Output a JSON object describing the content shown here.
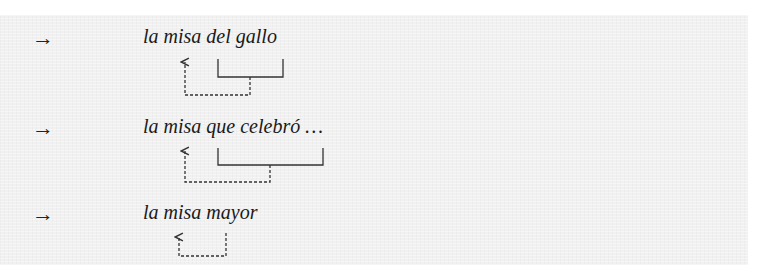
{
  "examples": [
    {
      "marker": "→",
      "text": "la misa del gallo",
      "head_word": "misa",
      "modifier": "del gallo",
      "modifier_type": "prepositional phrase"
    },
    {
      "marker": "→",
      "text": "la misa que celebró …",
      "head_word": "misa",
      "modifier": "que celebró …",
      "modifier_type": "relative clause"
    },
    {
      "marker": "→",
      "text": "la misa mayor",
      "head_word": "misa",
      "modifier": "mayor",
      "modifier_type": "adjective"
    }
  ],
  "colors": {
    "panel_background": "#f1f1f1",
    "text": "#1a1a1a",
    "lines": "#333333"
  }
}
